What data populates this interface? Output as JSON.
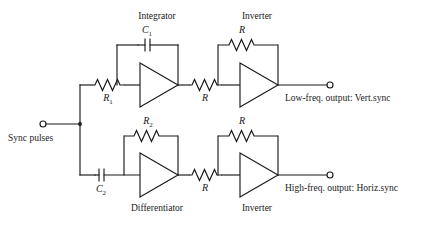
{
  "diagram": {
    "background": "#ffffff",
    "ink": "#1a1a1a"
  },
  "input": {
    "label": "Sync pulses",
    "terminal": "input-terminal"
  },
  "stages": {
    "integrator": {
      "label": "Integrator",
      "input_resistor": "R",
      "input_resistor_sub": "1",
      "feedback_capacitor": "C",
      "feedback_capacitor_sub": "1"
    },
    "top_inverter": {
      "label": "Inverter",
      "input_resistor": "R",
      "feedback_resistor": "R"
    },
    "differentiator": {
      "label": "Differentiator",
      "input_capacitor": "C",
      "input_capacitor_sub": "2",
      "feedback_resistor": "R",
      "feedback_resistor_sub": "2"
    },
    "bottom_inverter": {
      "label": "Inverter",
      "input_resistor": "R",
      "feedback_resistor": "R"
    }
  },
  "outputs": {
    "top": {
      "label": "Low-freq. output:  Vert.sync",
      "terminal": "top-output-terminal"
    },
    "bottom": {
      "label": "High-freq. output:  Horiz.sync",
      "terminal": "bottom-output-terminal"
    }
  }
}
